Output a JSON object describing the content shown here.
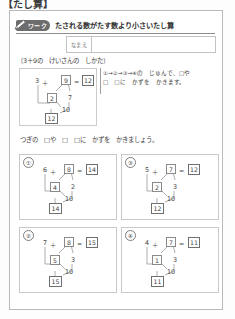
{
  "page": {
    "top_heading": "【たし算】",
    "header": {
      "tag_label": "ワーク",
      "pencil_icon": "pencil-icon",
      "title": "たされる数がたす数より小さいたし算"
    },
    "name_field": {
      "label": "なまえ",
      "value": "",
      "placeholder": ""
    },
    "example": {
      "instruction": "〔3＋9の　けいさんの　しかた〕",
      "left_addend": "3",
      "operator": "＋",
      "right_addend": "9",
      "equals": "=",
      "answer": "12",
      "split_left": "2",
      "split_right": "7",
      "ten": "10",
      "total": "12",
      "step_markers": [
        "①",
        "②",
        "③",
        "④"
      ]
    },
    "note": {
      "line1": "①→②→③→④の　じゅんで、□や",
      "line2": "□　□に　かずを　かきます。"
    },
    "mid_instruction": "つぎの　□や　□　□に　かずを　かきましょう。",
    "problems": [
      {
        "number": "①",
        "left_addend": "6",
        "operator": "＋",
        "right_addend": "8",
        "equals": "=",
        "answer": "14",
        "split_left": "4",
        "split_right": "2",
        "ten": "10",
        "total": "14"
      },
      {
        "number": "②",
        "left_addend": "7",
        "operator": "＋",
        "right_addend": "8",
        "equals": "=",
        "answer": "15",
        "split_left": "5",
        "split_right": "3",
        "ten": "10",
        "total": "15"
      },
      {
        "number": "③",
        "left_addend": "5",
        "operator": "＋",
        "right_addend": "7",
        "equals": "=",
        "answer": "12",
        "split_left": "2",
        "split_right": "3",
        "ten": "10",
        "total": "12"
      },
      {
        "number": "④",
        "left_addend": "4",
        "operator": "＋",
        "right_addend": "7",
        "equals": "=",
        "answer": "11",
        "split_left": "1",
        "split_right": "3",
        "ten": "10",
        "total": "11"
      }
    ],
    "colors": {
      "paper": "#ffffff",
      "ink": "#3f3f3f",
      "tag_bg": "#6d6d6d",
      "rule": "#8e8e8e",
      "box_border": "#8a8a8a",
      "card_border": "#c9c9c9"
    }
  }
}
